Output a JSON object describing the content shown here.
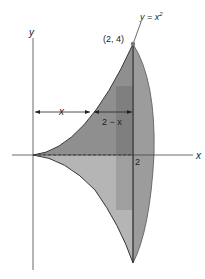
{
  "figure": {
    "axes": {
      "x_label": "x",
      "y_label": "y",
      "x_tick": "2"
    },
    "curve_label_prefix": "y = x",
    "curve_label_exp": "2",
    "point_label": "(2, 4)",
    "dimension_left": "x",
    "dimension_right": "2 − x",
    "colors": {
      "upper_region": "#8f8f8f",
      "lower_region": "#b3b3b3",
      "ellipse": "#9a9a9a",
      "strip": "#7d7d7d",
      "lines": "#333333"
    }
  }
}
